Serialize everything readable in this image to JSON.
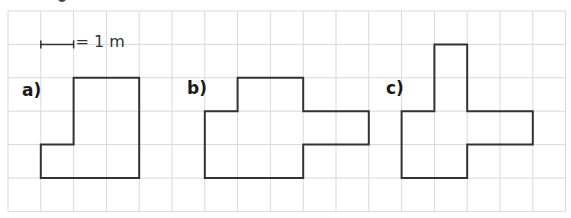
{
  "figure": {
    "type": "grid-area-exercise",
    "grid": {
      "columns": 17,
      "rows": 6,
      "origin_x": 8,
      "origin_y": 11,
      "cell_width": 32.8,
      "cell_height": 33.4,
      "line_color": "#d9d9d9",
      "outline_color": "#333333"
    },
    "scale": {
      "bar_from_col": 1,
      "bar_to_col": 2,
      "bar_row": 1,
      "text": "= 1 m"
    },
    "shapes": [
      {
        "id": "a",
        "label": "a)",
        "label_pos": [
          22,
          82
        ],
        "vertices": [
          [
            2,
            2
          ],
          [
            4,
            2
          ],
          [
            4,
            5
          ],
          [
            1,
            5
          ],
          [
            1,
            4
          ],
          [
            2,
            4
          ]
        ]
      },
      {
        "id": "b",
        "label": "b)",
        "label_pos": [
          187,
          80
        ],
        "vertices": [
          [
            7,
            2
          ],
          [
            9,
            2
          ],
          [
            9,
            3
          ],
          [
            11,
            3
          ],
          [
            11,
            4
          ],
          [
            9,
            4
          ],
          [
            9,
            5
          ],
          [
            6,
            5
          ],
          [
            6,
            3
          ],
          [
            7,
            3
          ]
        ]
      },
      {
        "id": "c",
        "label": "c)",
        "label_pos": [
          386,
          80
        ],
        "vertices": [
          [
            13,
            1
          ],
          [
            14,
            1
          ],
          [
            14,
            3
          ],
          [
            16,
            3
          ],
          [
            16,
            4
          ],
          [
            14,
            4
          ],
          [
            14,
            5
          ],
          [
            12,
            5
          ],
          [
            12,
            3
          ],
          [
            13,
            3
          ]
        ]
      }
    ]
  }
}
